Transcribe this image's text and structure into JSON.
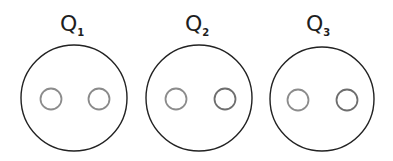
{
  "diagram": {
    "background": "#ffffff",
    "outer_stroke": "#222222",
    "outer_stroke_width": 1.4,
    "inner_stroke_width": 1.8,
    "panels": [
      {
        "label": "Q",
        "subscript": "1",
        "label_x": 60,
        "label_y": 31,
        "outer": {
          "cx": 74,
          "cy": 98,
          "r": 53
        },
        "inner": [
          {
            "cx": 51,
            "cy": 99,
            "r": 10.5,
            "color": "#8c8c8c"
          },
          {
            "cx": 99,
            "cy": 99,
            "r": 10.5,
            "color": "#8a8a8a"
          }
        ]
      },
      {
        "label": "Q",
        "subscript": "2",
        "label_x": 185,
        "label_y": 31,
        "outer": {
          "cx": 199,
          "cy": 98,
          "r": 53
        },
        "inner": [
          {
            "cx": 176,
            "cy": 99,
            "r": 10.5,
            "color": "#8c8c8c"
          },
          {
            "cx": 225,
            "cy": 99,
            "r": 10.5,
            "color": "#6e6e6e"
          }
        ]
      },
      {
        "label": "Q",
        "subscript": "3",
        "label_x": 306,
        "label_y": 31,
        "outer": {
          "cx": 322,
          "cy": 99,
          "r": 52
        },
        "inner": [
          {
            "cx": 298,
            "cy": 100,
            "r": 10.5,
            "color": "#8c8c8c"
          },
          {
            "cx": 347,
            "cy": 100,
            "r": 10.5,
            "color": "#6e6e6e"
          }
        ]
      }
    ]
  }
}
